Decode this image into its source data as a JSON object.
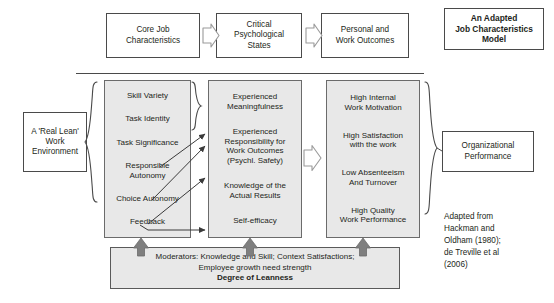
{
  "figure": {
    "title_box": "An Adapted\nJob Characteristics\nModel",
    "divider_label": ""
  },
  "headers": [
    {
      "label": "Core Job\nCharacteristics"
    },
    {
      "label": "Critical\nPsychological\nStates"
    },
    {
      "label": "Personal and\nWork Outcomes"
    }
  ],
  "left_context": {
    "label": "A 'Real Lean'\nWork\nEnvironment"
  },
  "columns": {
    "core_job_characteristics": [
      "Skill Variety",
      "Task Identity",
      "Task Significance",
      "Responsible\nAutonomy",
      "Choice Autonomy",
      "Feedback"
    ],
    "critical_psychological_states": [
      "Experienced\nMeaningfulness",
      "Experienced\nResponsibility for\nWork Outcomes\n(Psychl. Safety)",
      "Knowledge of the\nActual Results",
      "Self-efficacy"
    ],
    "personal_and_work_outcomes": [
      "High Internal\nWork Motivation",
      "High Satisfaction\nwith the work",
      "Low Absenteeism\nAnd Turnover",
      "High Quality\nWork Performance"
    ]
  },
  "right_outcome": {
    "label": "Organizational\nPerformance"
  },
  "moderators": {
    "line1": "Moderators:  Knowledge and Skill; Context Satisfactions;",
    "line2": "Employee growth need strength",
    "line3": "Degree of Leanness"
  },
  "attribution": "Adapted from\nHackman and\nOldham (1980);\nde Treville et al\n(2006)",
  "colors": {
    "box_fill": "#ffffff",
    "shaded_fill": "#e8e8e8",
    "stroke": "#4a4a4a",
    "arrow_gray": "#7f7f7f",
    "text": "#231f20"
  }
}
